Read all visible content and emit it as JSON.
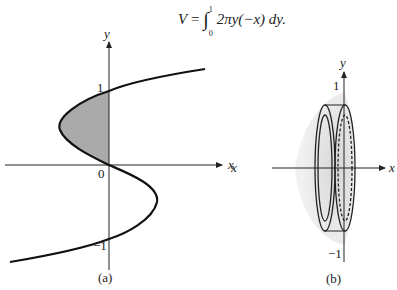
{
  "formula": {
    "lhs": "V",
    "eq": " = ",
    "int": "∫",
    "upper": "1",
    "lower": "0",
    "integrand": "2πy(−x) dy."
  },
  "panel_a": {
    "y_label": "y",
    "x_label": "x",
    "tick_one": "1",
    "tick_zero": "0",
    "tick_neg_one": "−1",
    "caption": "(a)"
  },
  "panel_b": {
    "y_label": "y",
    "x_label": "x",
    "x_label_left": "x",
    "tick_one": "1",
    "tick_neg_one": "−1",
    "caption": "(b)"
  }
}
